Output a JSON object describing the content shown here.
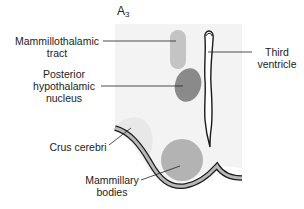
{
  "diagram": {
    "title": "A",
    "title_subscript": "3",
    "labels": {
      "mammillothalamic_tract": {
        "line1": "Mammillothalamic",
        "line2": "tract"
      },
      "posterior_hypothalamic_nucleus": {
        "line1": "Posterior",
        "line2": "hypothalamic",
        "line3": "nucleus"
      },
      "third_ventricle": {
        "line1": "Third",
        "line2": "ventricle"
      },
      "crus_cerebri": {
        "line1": "Crus cerebri"
      },
      "mammillary_bodies": {
        "line1": "Mammillary",
        "line2": "bodies"
      }
    },
    "colors": {
      "background_panel": "#f3f3f3",
      "mammillothalamic_tract": "#c4c4c4",
      "posterior_hypothalamic_nucleus": "#8a8a8a",
      "mammillary_bodies": "#b3b3b3",
      "crus_cerebri_shade": "#e6e6e6",
      "outline": "#1a1a1a"
    }
  }
}
